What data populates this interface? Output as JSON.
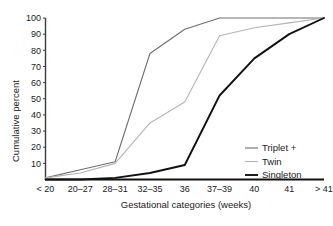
{
  "chart_data": {
    "type": "line",
    "title": "",
    "xlabel": "Gestational categories (weeks)",
    "ylabel": "Cumulative percent",
    "categories": [
      "< 20",
      "20–27",
      "28–31",
      "32–35",
      "36",
      "37–39",
      "40",
      "41",
      "> 41"
    ],
    "ylim": [
      0,
      100
    ],
    "yticks": [
      10,
      20,
      30,
      40,
      50,
      60,
      70,
      80,
      90,
      100
    ],
    "ytick_labels": [
      "10",
      "20",
      "30",
      "40",
      "50",
      "60",
      "70",
      "80",
      "90",
      "100"
    ],
    "grid": false,
    "legend_position": "bottom-right",
    "series": [
      {
        "name": "Triplet +",
        "color": "#6e6e6e",
        "width": 1.1,
        "values": [
          1,
          6,
          11,
          78,
          93,
          100,
          100,
          100,
          100
        ]
      },
      {
        "name": "Twin",
        "color": "#b4b4b4",
        "width": 1.1,
        "values": [
          1,
          4,
          10,
          35,
          48,
          89,
          94,
          97,
          100
        ]
      },
      {
        "name": "Singleton",
        "color": "#111111",
        "width": 1.9,
        "values": [
          0,
          0,
          1,
          4,
          9,
          52,
          75,
          90,
          100
        ]
      }
    ]
  },
  "legend": {
    "items": [
      {
        "label": "Triplet +",
        "color": "#6e6e6e",
        "width": 1.1
      },
      {
        "label": "Twin",
        "color": "#b4b4b4",
        "width": 1.1
      },
      {
        "label": "Singleton",
        "color": "#111111",
        "width": 1.9
      }
    ]
  },
  "axes": {
    "axis_color": "#3b3b3b",
    "x_axis_color": "#111111"
  }
}
